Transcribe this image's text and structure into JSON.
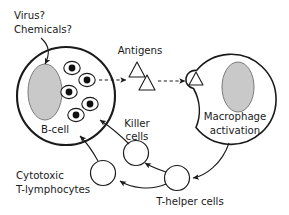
{
  "diagram": {
    "background_color": "#ffffff",
    "stroke_color": "#1a1a1a",
    "nucleus_fill": "#c9c9c9",
    "labels": {
      "virus": "Virus?",
      "chemicals": "Chemicals?",
      "antigens": "Antigens",
      "b_cell": "B-cell",
      "macrophage_line1": "Macrophage",
      "macrophage_line2": "activation",
      "killer_line1": "Killer",
      "killer_line2": "cells",
      "cytotoxic_line1": "Cytotoxic",
      "cytotoxic_line2": "T-lymphocytes",
      "t_helper": "T-helper cells"
    },
    "cells": [
      {
        "name": "b-cell",
        "cx": 66,
        "cy": 96,
        "r": 49,
        "stroke_width": 2.1
      },
      {
        "name": "macrophage",
        "cx": 235,
        "cy": 99,
        "r": 45,
        "stroke_width": 1.6
      }
    ],
    "nuclei": [
      {
        "name": "b-cell-nucleus",
        "cx": 45,
        "cy": 92,
        "rx": 17,
        "ry": 28
      },
      {
        "name": "macrophage-nucleus",
        "cx": 238,
        "cy": 87,
        "rx": 16,
        "ry": 25
      }
    ],
    "vesicles": [
      {
        "cx": 72,
        "cy": 68
      },
      {
        "cx": 87,
        "cy": 80
      },
      {
        "cx": 69,
        "cy": 92
      },
      {
        "cx": 90,
        "cy": 104
      },
      {
        "cx": 76,
        "cy": 115
      }
    ],
    "antigen_triangles": [
      {
        "name": "antigen-1",
        "cx": 137,
        "cy": 70,
        "size": 9
      },
      {
        "name": "antigen-2",
        "cx": 147,
        "cy": 83,
        "size": 9
      },
      {
        "name": "antigen-engulfed",
        "cx": 196,
        "cy": 79,
        "size": 9
      }
    ],
    "small_cells": [
      {
        "name": "killer-cell",
        "cx": 136,
        "cy": 153,
        "r": 12.5
      },
      {
        "name": "cytotoxic-cell",
        "cx": 103,
        "cy": 173,
        "r": 12.5
      },
      {
        "name": "t-helper-cell",
        "cx": 177,
        "cy": 178,
        "r": 12.5
      }
    ],
    "flow_arrows": [
      {
        "name": "virus-to-bcell",
        "style": "solid"
      },
      {
        "name": "bcell-to-antigens",
        "style": "dashed"
      },
      {
        "name": "antigens-to-macrophage",
        "style": "dashed"
      },
      {
        "name": "macrophage-to-thelper",
        "style": "solid"
      },
      {
        "name": "thelper-to-killer",
        "style": "solid"
      },
      {
        "name": "thelper-to-cytotoxic",
        "style": "solid"
      },
      {
        "name": "killer-to-bcell",
        "style": "solid"
      },
      {
        "name": "cytotoxic-to-bcell",
        "style": "solid"
      }
    ]
  }
}
